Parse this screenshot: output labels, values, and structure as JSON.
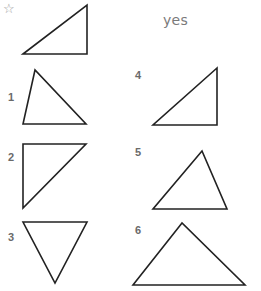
{
  "example": {
    "marker_icon": "star-outline-icon",
    "marker_glyph": "☆",
    "answer": "yes",
    "triangle": "23,54 87,5 87,54"
  },
  "items": [
    {
      "label": "1",
      "triangle": "35,70 23,124 86,124"
    },
    {
      "label": "2",
      "triangle": "23,144 86,144 23,208"
    },
    {
      "label": "3",
      "triangle": "23,222 87,222 55,283"
    },
    {
      "label": "4",
      "triangle": "217,68 153,125 217,125"
    },
    {
      "label": "5",
      "triangle": "202,151 153,209 227,209"
    },
    {
      "label": "6",
      "triangle": "182,223 133,285 245,285"
    }
  ],
  "colors": {
    "stroke": "#222222",
    "label": "#6a6a6a",
    "answer": "#7a7a7a"
  }
}
